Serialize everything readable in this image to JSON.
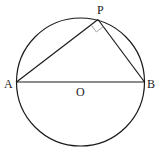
{
  "diagram": {
    "type": "geometry",
    "labels": {
      "P": "P",
      "A": "A",
      "B": "B",
      "O": "O"
    },
    "colors": {
      "stroke": "#1a1a1a",
      "right_angle_mark": "#a0a0a0",
      "background": "#ffffff"
    },
    "elements": [
      {
        "kind": "circle",
        "center": "O"
      },
      {
        "kind": "segment",
        "from": "A",
        "to": "B",
        "role": "diameter"
      },
      {
        "kind": "segment",
        "from": "A",
        "to": "P"
      },
      {
        "kind": "segment",
        "from": "P",
        "to": "B"
      },
      {
        "kind": "right-angle-mark",
        "at": "P"
      }
    ]
  }
}
